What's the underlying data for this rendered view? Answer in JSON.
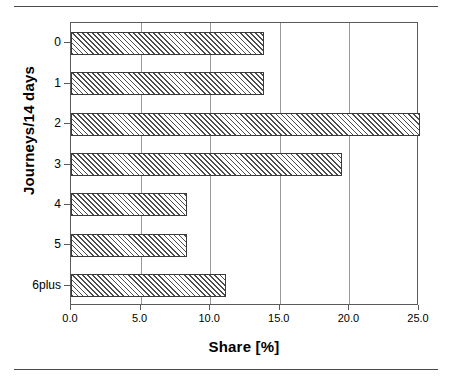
{
  "chart_data": {
    "type": "bar",
    "orientation": "horizontal",
    "title": "",
    "subtitle": "",
    "xlabel": "Share [%]",
    "ylabel": "Journeys/14 days",
    "categories": [
      "0",
      "1",
      "2",
      "3",
      "4",
      "5",
      "6plus"
    ],
    "values": [
      13.9,
      13.9,
      25.1,
      19.5,
      8.3,
      8.3,
      11.1
    ],
    "series": [
      {
        "name": "Share",
        "values": [
          13.9,
          13.9,
          25.1,
          19.5,
          8.3,
          8.3,
          11.1
        ]
      }
    ],
    "xlim": [
      0.0,
      25.0
    ],
    "xticks": [
      0.0,
      5.0,
      10.0,
      15.0,
      20.0,
      25.0
    ],
    "xtick_labels": [
      "0.0",
      "5.0",
      "10.0",
      "15.0",
      "20.0",
      "25.0"
    ],
    "grid": "vertical",
    "legend": "none",
    "bar_fill": "diagonal-hatch",
    "bar_edge_color": "#3a3a3a",
    "grid_color": "#9a9a9a",
    "axis_color": "#5a5a5a",
    "background_color": "#ffffff"
  }
}
